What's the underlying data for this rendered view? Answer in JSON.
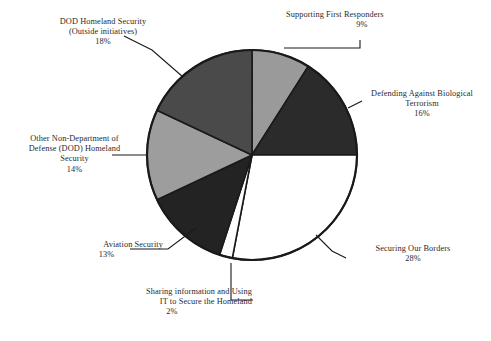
{
  "chart_data": {
    "type": "pie",
    "title": "",
    "subtitle": "",
    "xlabel": "",
    "ylabel": "",
    "legend_position": "none",
    "labels_position": "outside-with-leader-lines",
    "start_angle_deg": 0,
    "direction": "clockwise",
    "total_percent": 100,
    "categories": [
      "Supporting First Responders",
      "Defending Against Biological Terrorism",
      "Securing Our Borders",
      "Sharing information and Using IT to Secure the Homeland",
      "Aviation Security",
      "Other Non-Department of Defense (DOD) Homeland Security",
      "DOD Homeland Security (Outside initiatives)"
    ],
    "values": [
      9,
      16,
      28,
      2,
      13,
      14,
      18
    ],
    "value_labels": [
      "9%",
      "16%",
      "28%",
      "2%",
      "13%",
      "14%",
      "18%"
    ],
    "slice_colors": [
      "#9a9a9a",
      "#2b2b2b",
      "#ffffff",
      "#fdfdfd",
      "#232323",
      "#9d9d9d",
      "#4a4a4a"
    ],
    "slices": [
      {
        "name": "Supporting First Responders",
        "value": 9,
        "value_label": "9%",
        "color": "#9a9a9a"
      },
      {
        "name": "Defending Against Biological Terrorism",
        "value": 16,
        "value_label": "16%",
        "color": "#2b2b2b"
      },
      {
        "name": "Securing Our Borders",
        "value": 28,
        "value_label": "28%",
        "color": "#ffffff"
      },
      {
        "name": "Sharing information and Using IT to Secure the Homeland",
        "value": 2,
        "value_label": "2%",
        "color": "#fdfdfd"
      },
      {
        "name": "Aviation Security",
        "value": 13,
        "value_label": "13%",
        "color": "#232323"
      },
      {
        "name": "Other Non-Department of Defense (DOD) Homeland Security",
        "value": 14,
        "value_label": "14%",
        "color": "#9d9d9d"
      },
      {
        "name": "DOD Homeland Security (Outside initiatives)",
        "value": 18,
        "value_label": "18%",
        "color": "#4a4a4a"
      }
    ],
    "outline_color": "#1a1a1a",
    "background_color": "#ffffff"
  },
  "labels": {
    "supporting_first_responders": {
      "line1": "Supporting First Responders",
      "pct": "9%"
    },
    "defending_biological_terrorism": {
      "line1": "Defending Against Biological",
      "line2": "Terrorism",
      "pct": "16%"
    },
    "securing_our_borders": {
      "line1": "Securing Our Borders",
      "pct": "28%"
    },
    "sharing_information": {
      "line1": "Sharing information and Using",
      "line2": "IT to Secure the Homeland",
      "pct": "2%"
    },
    "aviation_security": {
      "line1": "Aviation Security",
      "pct": "13%"
    },
    "other_non_dod": {
      "line1": "Other Non-Department of",
      "line2": "Defense (DOD) Homeland",
      "line3": "Security",
      "pct": "14%"
    },
    "dod_outside_initiatives": {
      "line1": "DOD Homeland Security",
      "line2": "(Outside initiatives)",
      "pct": "18%"
    }
  }
}
